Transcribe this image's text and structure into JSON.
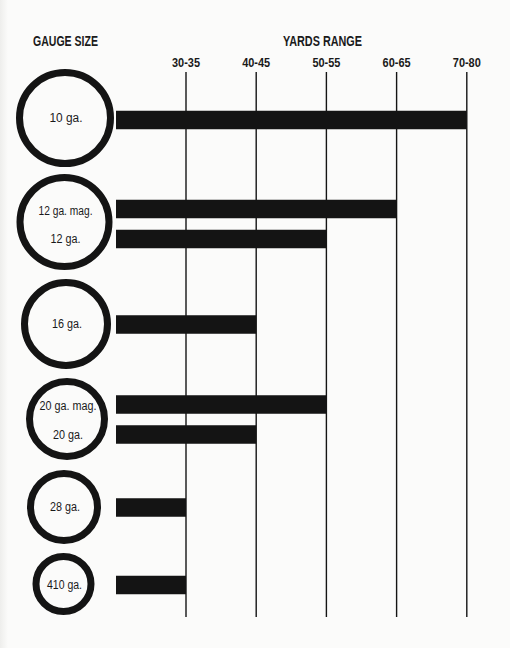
{
  "chart_data": {
    "type": "bar",
    "orientation": "horizontal",
    "title": "",
    "ylabel": "GAUGE SIZE",
    "xlabel": "YARDS RANGE",
    "x_categories": [
      "30-35",
      "40-45",
      "50-55",
      "60-65",
      "70-80"
    ],
    "grid": true,
    "legend": "none",
    "groups": [
      {
        "name": "10 ga.",
        "bars": [
          {
            "label": "10 ga.",
            "value": "70-80"
          }
        ]
      },
      {
        "name": "12 ga.",
        "bars": [
          {
            "label": "12 ga. mag.",
            "value": "60-65"
          },
          {
            "label": "12 ga.",
            "value": "50-55"
          }
        ]
      },
      {
        "name": "16 ga.",
        "bars": [
          {
            "label": "16 ga.",
            "value": "40-45"
          }
        ]
      },
      {
        "name": "20 ga.",
        "bars": [
          {
            "label": "20 ga. mag.",
            "value": "50-55"
          },
          {
            "label": "20 ga.",
            "value": "40-45"
          }
        ]
      },
      {
        "name": "28 ga.",
        "bars": [
          {
            "label": "28 ga.",
            "value": "30-35"
          }
        ]
      },
      {
        "name": "410 ga.",
        "bars": [
          {
            "label": "410 ga.",
            "value": "30-35"
          }
        ]
      }
    ],
    "categories": [
      "10 ga.",
      "12 ga. mag.",
      "12 ga.",
      "16 ga.",
      "20 ga. mag.",
      "20 ga.",
      "28 ga.",
      "410 ga."
    ],
    "values": [
      "70-80",
      "60-65",
      "50-55",
      "40-45",
      "50-55",
      "40-45",
      "30-35",
      "30-35"
    ],
    "colors": {
      "ink": "#141414",
      "background": "#fbfbfa"
    }
  }
}
